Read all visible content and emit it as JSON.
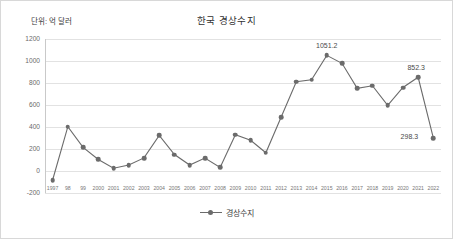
{
  "chart": {
    "title": "한국 경상수지",
    "unit_label": "단위: 억 달러",
    "legend_label": "경상수지"
  },
  "chart_data": {
    "type": "line",
    "title": "한국 경상수지",
    "subtitle": "단위: 억 달러",
    "xlabel": "",
    "ylabel": "",
    "unit": "억 달러",
    "ylim": [
      -200,
      1200
    ],
    "yticks": [
      "1200",
      "1000",
      "800",
      "600",
      "400",
      "200",
      "0",
      "-200"
    ],
    "grid": true,
    "legend_position": "bottom",
    "categories": [
      "1997",
      "98",
      "99",
      "2000",
      "2001",
      "2002",
      "2003",
      "2004",
      "2005",
      "2006",
      "2007",
      "2008",
      "2009",
      "2010",
      "2011",
      "2012",
      "2013",
      "2014",
      "2015",
      "2016",
      "2017",
      "2018",
      "2019",
      "2020",
      "2021",
      "2022"
    ],
    "series": [
      {
        "name": "경상수지",
        "values": [
          -82,
          403,
          215,
          105,
          25,
          54,
          119,
          323,
          150,
          54,
          118,
          32,
          330,
          279,
          166,
          488,
          811,
          830,
          1051.2,
          979,
          752,
          775,
          597,
          759,
          852.3,
          298.3
        ]
      }
    ],
    "point_labels": [
      {
        "category": "2015",
        "value": 1051.2,
        "text": "1051.2"
      },
      {
        "category": "2021",
        "value": 852.3,
        "text": "852.3"
      },
      {
        "category": "2022",
        "value": 298.3,
        "text": "298.3"
      }
    ],
    "colors": {
      "series": "#6b6b6b",
      "grid": "#e2e2e2",
      "text": "#4a4a4a",
      "background": "#ffffff"
    }
  }
}
